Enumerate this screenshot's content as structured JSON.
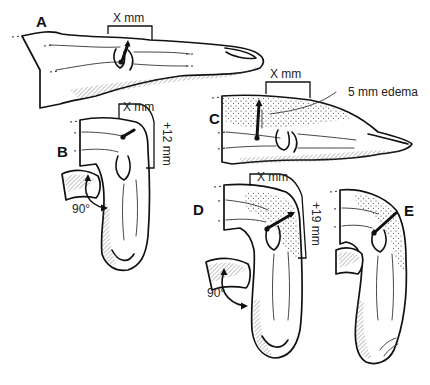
{
  "figure": {
    "panels": [
      {
        "id": "A",
        "label": "A",
        "measure": "X mm",
        "description": "Finger extended, measurement across PIP joint"
      },
      {
        "id": "B",
        "label": "B",
        "measure": "X mm",
        "extra": "+12 mm",
        "angle": "90°",
        "description": "Finger flexed 90°, measurement increases"
      },
      {
        "id": "C",
        "label": "C",
        "measure": "X mm",
        "annotation": "5 mm edema",
        "description": "Finger extended with dorsal edema"
      },
      {
        "id": "D",
        "label": "D",
        "measure": "X mm",
        "extra": "+19 mm",
        "angle": "90°",
        "description": "Flexed edematous finger, measurement increases"
      },
      {
        "id": "E",
        "label": "E",
        "description": "Flexed edematous finger"
      }
    ],
    "signature": "artist signature"
  }
}
